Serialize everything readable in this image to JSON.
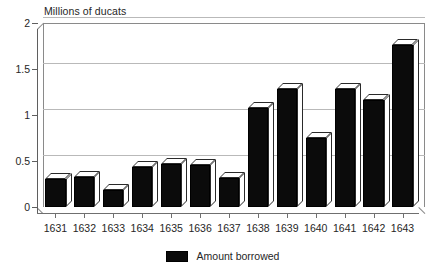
{
  "chart_data": {
    "type": "bar",
    "title": "",
    "xlabel": "",
    "ylabel": "Millions of ducats",
    "ylim": [
      0,
      2
    ],
    "yticks": [
      "0",
      "0.5",
      "1",
      "1.5",
      "2"
    ],
    "ytick_values": [
      0,
      0.5,
      1,
      1.5,
      2
    ],
    "grid": true,
    "style": "3d-bars",
    "legend_position": "bottom-center",
    "categories": [
      "1631",
      "1632",
      "1633",
      "1634",
      "1635",
      "1636",
      "1637",
      "1638",
      "1639",
      "1640",
      "1641",
      "1642",
      "1643"
    ],
    "series": [
      {
        "name": "Amount borrowed",
        "color": "#0b0b0b",
        "values": [
          0.3,
          0.33,
          0.19,
          0.43,
          0.47,
          0.46,
          0.31,
          1.08,
          1.28,
          0.75,
          1.28,
          1.16,
          1.76
        ]
      }
    ],
    "legend": [
      "Amount borrowed"
    ]
  },
  "axis": {
    "y_title": "Millions of ducats"
  },
  "legend": {
    "items": [
      {
        "label": "Amount borrowed",
        "color": "#0b0b0b"
      }
    ]
  }
}
